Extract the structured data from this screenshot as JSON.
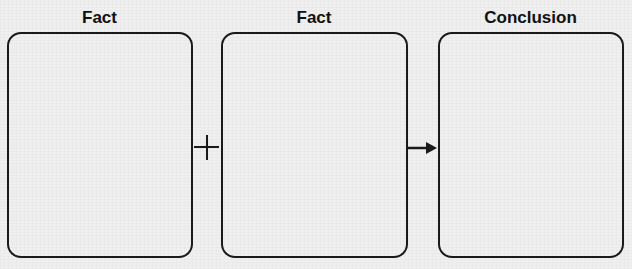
{
  "diagram": {
    "columns": [
      {
        "label": "Fact",
        "content": ""
      },
      {
        "label": "Fact",
        "content": ""
      },
      {
        "label": "Conclusion",
        "content": ""
      }
    ],
    "operators": [
      {
        "type": "plus",
        "symbol": "+"
      },
      {
        "type": "arrow",
        "symbol": "→"
      }
    ],
    "colors": {
      "stroke": "#1a1a1a",
      "background": "#efefef",
      "text": "#111111"
    }
  }
}
